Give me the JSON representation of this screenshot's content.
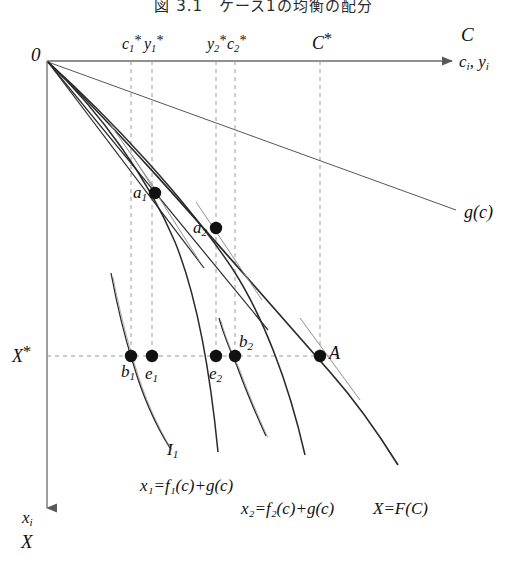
{
  "figure": {
    "title": "図 3.1　ケース1の均衡の配分",
    "type": "economics-diagram"
  },
  "axes": {
    "horizontal": {
      "label_top": "C",
      "label_bottom": "c_i , y_i",
      "label_bottom_main": "c",
      "label_bottom_sub1": "i",
      "label_bottom_main2": "y",
      "label_bottom_sub2": "i",
      "origin_label": "0",
      "direction": "right"
    },
    "vertical": {
      "label_top": "x_i",
      "label_top_main": "x",
      "label_top_sub": "i",
      "label_bottom": "X",
      "direction": "down"
    }
  },
  "tick_labels": [
    {
      "name": "c1-star",
      "main": "c",
      "sub": "1",
      "star": "*",
      "x": 131
    },
    {
      "name": "y1-star",
      "main": "y",
      "sub": "1",
      "star": "*",
      "x": 152
    },
    {
      "name": "y2-star",
      "main": "y",
      "sub": "2",
      "star": "*",
      "x": 216
    },
    {
      "name": "c2-star",
      "main": "c",
      "sub": "2",
      "star": "*",
      "x": 235
    },
    {
      "name": "C-star",
      "main": "C",
      "sub": "",
      "star": "*",
      "x": 320
    }
  ],
  "level_line": {
    "label_main": "X",
    "label_star": "*",
    "y": 356
  },
  "points": [
    {
      "name": "a1",
      "main": "a",
      "sub": "1",
      "x": 155,
      "y": 193,
      "label_dx": -20,
      "label_dy": -2
    },
    {
      "name": "a2",
      "main": "a",
      "sub": "2",
      "x": 216,
      "y": 228,
      "label_dx": -21,
      "label_dy": -2
    },
    {
      "name": "b1",
      "main": "b",
      "sub": "1",
      "x": 131,
      "y": 356,
      "label_dx": -7,
      "label_dy": 15
    },
    {
      "name": "e1",
      "main": "e",
      "sub": "1",
      "x": 152,
      "y": 356,
      "label_dx": -5,
      "label_dy": 16
    },
    {
      "name": "e2",
      "main": "e",
      "sub": "2",
      "x": 216,
      "y": 356,
      "label_dx": -6,
      "label_dy": 16
    },
    {
      "name": "b2",
      "main": "b",
      "sub": "2",
      "x": 235,
      "y": 356,
      "label_dx": 4,
      "label_dy": -14
    },
    {
      "name": "A",
      "main": "A",
      "sub": "",
      "x": 320,
      "y": 356,
      "label_dx": 9,
      "label_dy": -2
    }
  ],
  "curve_labels": [
    {
      "name": "g-of-c",
      "text": "g(c)",
      "x": 468,
      "y": 205
    },
    {
      "name": "indifference-I1",
      "main": "I",
      "sub": "1",
      "x": 170,
      "y": 449
    },
    {
      "name": "x1-equation",
      "text": "x₁=f₁(c)+g(c)",
      "x": 145,
      "y": 485
    },
    {
      "name": "x2-equation",
      "text": "x₂=f₂(c)+g(c)",
      "x": 246,
      "y": 508
    },
    {
      "name": "X-equation",
      "text": "X=F(C)",
      "x": 378,
      "y": 508
    }
  ],
  "colors": {
    "axis": "#6b6b6b",
    "curve": "#2a2a2a",
    "curve_light": "#8a8a8a",
    "dashed": "#9a9a9a",
    "point": "#111111",
    "background": "#ffffff"
  }
}
